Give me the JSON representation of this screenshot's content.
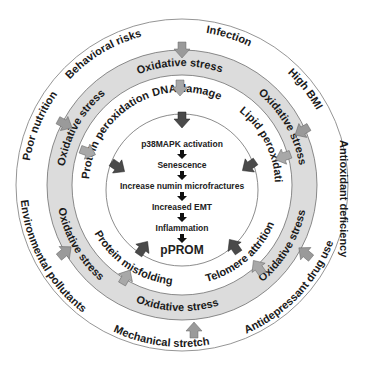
{
  "diagram": {
    "type": "concentric-circle-pathway",
    "colors": {
      "band_fill": "#dcdcdc",
      "ring_stroke": "#6e6e6e",
      "outer_arrow": "#9a9a9a",
      "middle_arrow": "#a8a8a8",
      "inner_arrow": "#4a4a4a",
      "text": "#1a1a1a"
    },
    "outer_ring_factors": [
      "Behavioral risks",
      "Infection",
      "High BMI",
      "Antioxidant deficiency",
      "Antidepressant drug use",
      "Mechanical stretch",
      "Environmental pollutants",
      "Poor nutrition"
    ],
    "band_label": "Oxidative stress",
    "band_labels": [
      "Oxidative stress",
      "Oxidative stress",
      "Oxidative stress",
      "Oxidative stress",
      "Oxidative stress",
      "Oxidative stress"
    ],
    "damage_mechanisms": [
      "DNA damage",
      "Lipid peroxidation",
      "Telomere attrition",
      "Protein misfolding",
      "Protein peroxidation"
    ],
    "center_pathway": [
      "p38MAPK activation",
      "Senescence",
      "Increase numin microfractures",
      "Increased EMT",
      "Inflammation",
      "pPROM"
    ]
  }
}
